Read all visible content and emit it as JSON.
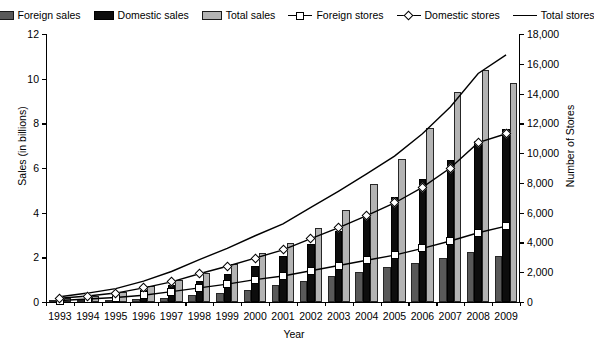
{
  "legend": {
    "items": [
      {
        "label": "Foreign sales",
        "icon": "bar-swatch-dark-gray"
      },
      {
        "label": "Domestic sales",
        "icon": "bar-swatch-black"
      },
      {
        "label": "Total sales",
        "icon": "bar-swatch-light-gray"
      },
      {
        "label": "Foreign stores",
        "icon": "line-square-marker"
      },
      {
        "label": "Domestic stores",
        "icon": "line-diamond-marker"
      },
      {
        "label": "Total stores",
        "icon": "line-plain"
      }
    ]
  },
  "chart_data": {
    "type": "bar",
    "title": "",
    "xlabel": "Year",
    "ylabel": "Sales (in billions)",
    "y2label": "Number of Stores",
    "grid": false,
    "legend_position": "top",
    "categories": [
      "1993",
      "1994",
      "1995",
      "1996",
      "1997",
      "1998",
      "1999",
      "2000",
      "2001",
      "2002",
      "2003",
      "2004",
      "2005",
      "2006",
      "2007",
      "2008",
      "2009"
    ],
    "ylim": [
      0,
      12
    ],
    "yticks": [
      0,
      2,
      4,
      6,
      8,
      10,
      12
    ],
    "yticklabels": [
      "0",
      "2",
      "4",
      "6",
      "8",
      "10",
      "12"
    ],
    "y2lim": [
      0,
      18000
    ],
    "y2ticks": [
      0,
      2000,
      4000,
      6000,
      8000,
      10000,
      12000,
      14000,
      16000,
      18000
    ],
    "y2ticklabels": [
      "0",
      "2,000",
      "4,000",
      "6,000",
      "8,000",
      "10,000",
      "12,000",
      "14,000",
      "16,000",
      "18,000"
    ],
    "series": [
      {
        "name": "Foreign sales",
        "axis": "left",
        "kind": "bar",
        "color": "#595959",
        "values": [
          0.03,
          0.05,
          0.08,
          0.12,
          0.2,
          0.3,
          0.42,
          0.55,
          0.75,
          0.95,
          1.15,
          1.35,
          1.55,
          1.75,
          1.95,
          2.25,
          2.05
        ]
      },
      {
        "name": "Domestic sales",
        "axis": "left",
        "kind": "bar",
        "color": "#0d0d0d",
        "values": [
          0.16,
          0.25,
          0.38,
          0.55,
          0.75,
          0.95,
          1.25,
          1.6,
          2.05,
          2.6,
          3.2,
          3.9,
          4.7,
          5.5,
          6.35,
          7.2,
          7.75
        ]
      },
      {
        "name": "Total sales",
        "axis": "left",
        "kind": "bar",
        "color": "#b3b3b3",
        "values": [
          0.18,
          0.28,
          0.46,
          0.7,
          0.97,
          1.3,
          1.68,
          2.2,
          2.65,
          3.3,
          4.1,
          5.3,
          6.4,
          7.8,
          9.4,
          10.4,
          9.8
        ]
      },
      {
        "name": "Foreign stores",
        "axis": "right",
        "kind": "line",
        "marker": "square",
        "values": [
          100,
          200,
          300,
          450,
          700,
          950,
          1200,
          1500,
          1750,
          2100,
          2450,
          2800,
          3150,
          3600,
          4100,
          4650,
          5100
        ]
      },
      {
        "name": "Domestic stores",
        "axis": "right",
        "kind": "line",
        "marker": "diamond",
        "values": [
          250,
          400,
          600,
          950,
          1350,
          1900,
          2400,
          2950,
          3500,
          4250,
          5000,
          5800,
          6650,
          7700,
          9000,
          10700,
          11300
        ]
      },
      {
        "name": "Total stores",
        "axis": "right",
        "kind": "line",
        "marker": "none",
        "values": [
          350,
          600,
          900,
          1400,
          2050,
          2850,
          3600,
          4450,
          5250,
          6350,
          7450,
          8600,
          9800,
          11300,
          13100,
          15350,
          16600
        ]
      }
    ]
  }
}
